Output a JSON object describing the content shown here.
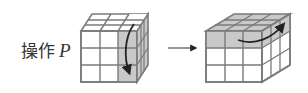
{
  "label": {
    "text": "操作",
    "variable": "P"
  },
  "colors": {
    "line": "#7a7a7a",
    "shaded": "#c9c9c9",
    "white": "#ffffff",
    "arrow": "#222222",
    "text": "#333333"
  },
  "figures": [
    {
      "name": "cube-before",
      "shaded": "right column (front + side)",
      "rotation_arrow": "downward on right column"
    },
    {
      "name": "cube-after",
      "shaded": "top row (front + top)",
      "rotation_arrow": "rightward on top row"
    }
  ],
  "transition_arrow": {
    "direction": "right"
  }
}
